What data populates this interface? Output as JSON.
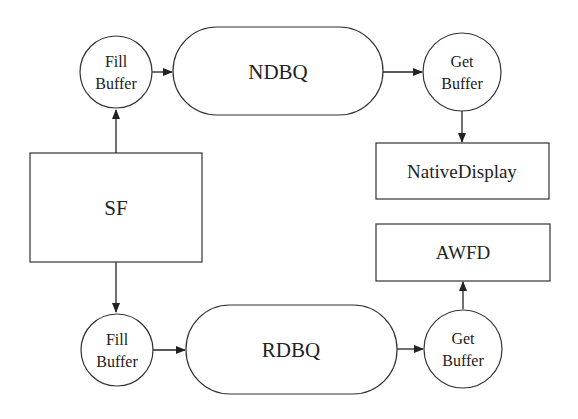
{
  "diagram": {
    "nodes": {
      "sf": {
        "label": "SF"
      },
      "fill_top": {
        "line1": "Fill",
        "line2": "Buffer"
      },
      "ndbq": {
        "label": "NDBQ"
      },
      "get_top": {
        "line1": "Get",
        "line2": "Buffer"
      },
      "native_display": {
        "label": "NativeDisplay"
      },
      "fill_bottom": {
        "line1": "Fill",
        "line2": "Buffer"
      },
      "rdbq": {
        "label": "RDBQ"
      },
      "get_bottom": {
        "line1": "Get",
        "line2": "Buffer"
      },
      "awfd": {
        "label": "AWFD"
      }
    },
    "edges": [
      {
        "from": "SF",
        "to": "Fill Buffer (top)"
      },
      {
        "from": "Fill Buffer (top)",
        "to": "NDBQ"
      },
      {
        "from": "NDBQ",
        "to": "Get Buffer (top)"
      },
      {
        "from": "Get Buffer (top)",
        "to": "NativeDisplay"
      },
      {
        "from": "SF",
        "to": "Fill Buffer (bottom)"
      },
      {
        "from": "Fill Buffer (bottom)",
        "to": "RDBQ"
      },
      {
        "from": "RDBQ",
        "to": "Get Buffer (bottom)"
      },
      {
        "from": "Get Buffer (bottom)",
        "to": "AWFD"
      }
    ]
  }
}
